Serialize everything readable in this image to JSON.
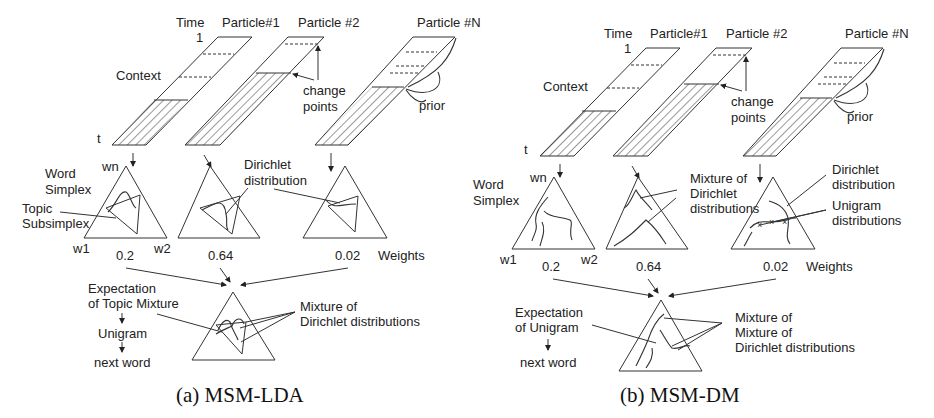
{
  "panels": [
    {
      "id": "a",
      "caption": "(a) MSM-LDA",
      "labels": {
        "time": "Time",
        "time_start": "1",
        "time_end": "t",
        "context": "Context",
        "particle1": "Particle#1",
        "particle2": "Particle #2",
        "particleN": "Particle #N",
        "change_points_1": "change",
        "change_points_2": "points",
        "prior": "prior",
        "word_simplex_1": "Word",
        "word_simplex_2": "Simplex",
        "wn": "wn",
        "w1": "w1",
        "w2": "w2",
        "topic_subsimplex_1": "Topic",
        "topic_subsimplex_2": "Subsimplex",
        "dirichlet_1": "Dirichlet",
        "dirichlet_2": "distribution",
        "weight1": "0.2",
        "weight2": "0.64",
        "weightN": "0.02",
        "weights": "Weights",
        "expectation_1": "Expectation",
        "expectation_2": "of Topic Mixture",
        "unigram": "Unigram",
        "next_word": "next word",
        "mixture_1": "Mixture of",
        "mixture_2": "Dirichlet distributions"
      }
    },
    {
      "id": "b",
      "caption": "(b) MSM-DM",
      "labels": {
        "time": "Time",
        "time_start": "1",
        "time_end": "t",
        "context": "Context",
        "particle1": "Particle#1",
        "particle2": "Particle #2",
        "particleN": "Particle #N",
        "change_points_1": "change",
        "change_points_2": "points",
        "prior": "prior",
        "word_simplex_1": "Word",
        "word_simplex_2": "Simplex",
        "wn": "wn",
        "w1": "w1",
        "w2": "w2",
        "mixture_dir_1": "Mixture of",
        "mixture_dir_2": "Dirichlet",
        "mixture_dir_3": "distributions",
        "dirichlet_1": "Dirichlet",
        "dirichlet_2": "distribution",
        "unigram_dist_1": "Unigram",
        "unigram_dist_2": "distributions",
        "weight1": "0.2",
        "weight2": "0.64",
        "weightN": "0.02",
        "weights": "Weights",
        "expectation_1": "Expectation",
        "expectation_2": "of Unigram",
        "next_word": "next word",
        "mixture_1": "Mixture of",
        "mixture_2": "Mixture of",
        "mixture_3": "Dirichlet distributions"
      }
    }
  ]
}
